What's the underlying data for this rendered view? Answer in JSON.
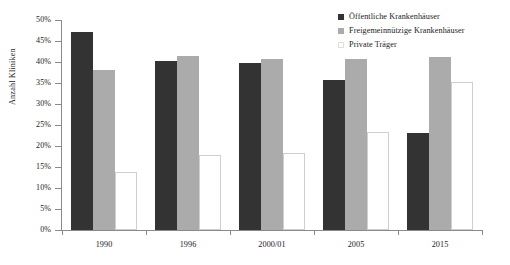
{
  "chart_data": {
    "type": "bar",
    "title": "",
    "xlabel": "",
    "ylabel": "Anzahl Kliniken",
    "ylim": [
      0,
      50
    ],
    "y_tick_labels": [
      "50%",
      "45%",
      "40%",
      "35%",
      "30%",
      "25%",
      "20%",
      "15%",
      "10%",
      "5%",
      "0%"
    ],
    "y_tick_values": [
      50,
      45,
      40,
      35,
      30,
      25,
      20,
      15,
      10,
      5,
      0
    ],
    "grid": false,
    "legend_position": "top-right",
    "categories": [
      "1990",
      "1996",
      "2000/01",
      "2005",
      "2015"
    ],
    "series": [
      {
        "name": "Öffentliche Krankenhäuser",
        "color": "#333333",
        "swatch": "filled-dark-square",
        "values": [
          47.2,
          40.2,
          39.8,
          35.7,
          23.1
        ]
      },
      {
        "name": "Freigemeinnützige Krankenhäuser",
        "color": "#ababab",
        "swatch": "filled-gray-square",
        "values": [
          38.1,
          41.4,
          40.7,
          40.7,
          41.2
        ]
      },
      {
        "name": "Private Träger",
        "color": "#ffffff",
        "swatch": "outlined-white-square",
        "values": [
          13.8,
          17.9,
          18.3,
          23.3,
          35.2
        ]
      }
    ]
  }
}
